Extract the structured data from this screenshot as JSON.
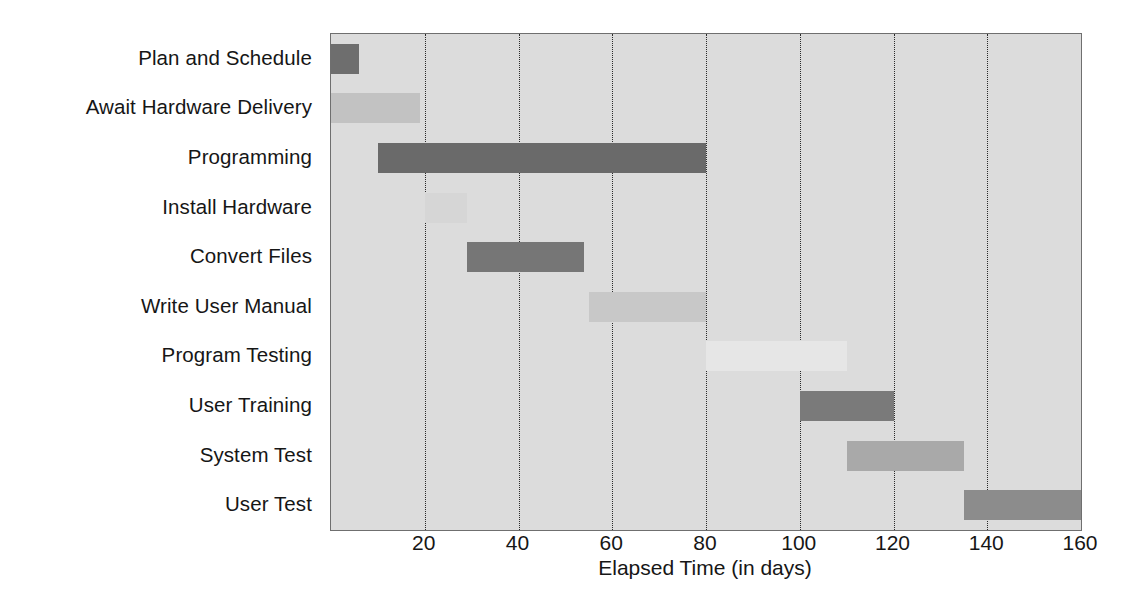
{
  "chart_data": {
    "type": "bar",
    "subtype": "gantt",
    "title": "",
    "xlabel": "Elapsed Time (in days)",
    "ylabel": "",
    "xlim": [
      0,
      160
    ],
    "xticks": [
      20,
      40,
      60,
      80,
      100,
      120,
      140,
      160
    ],
    "xtick_labels": [
      "20",
      "40",
      "60",
      "80",
      "100",
      "120",
      "140",
      "160"
    ],
    "grid": "vertical-dotted",
    "legend": "none",
    "categories": [
      "Plan and Schedule",
      "Await Hardware Delivery",
      "Programming",
      "Install Hardware",
      "Convert Files",
      "Write User Manual",
      "Program Testing",
      "User Training",
      "System Test",
      "User Test"
    ],
    "tasks": [
      {
        "name": "Plan and Schedule",
        "start": 0,
        "end": 6,
        "duration": 6,
        "color": "#6e6e6e"
      },
      {
        "name": "Await Hardware Delivery",
        "start": 0,
        "end": 19,
        "duration": 19,
        "color": "#c2c2c2"
      },
      {
        "name": "Programming",
        "start": 10,
        "end": 80,
        "duration": 70,
        "color": "#6a6a6a"
      },
      {
        "name": "Install Hardware",
        "start": 20,
        "end": 29,
        "duration": 9,
        "color": "#d6d6d6"
      },
      {
        "name": "Convert Files",
        "start": 29,
        "end": 54,
        "duration": 25,
        "color": "#767676"
      },
      {
        "name": "Write User Manual",
        "start": 55,
        "end": 80,
        "duration": 25,
        "color": "#c8c8c8"
      },
      {
        "name": "Program Testing",
        "start": 80,
        "end": 110,
        "duration": 30,
        "color": "#e6e6e6"
      },
      {
        "name": "User Training",
        "start": 100,
        "end": 120,
        "duration": 20,
        "color": "#7a7a7a"
      },
      {
        "name": "System Test",
        "start": 110,
        "end": 135,
        "duration": 25,
        "color": "#a9a9a9"
      },
      {
        "name": "User Test",
        "start": 135,
        "end": 160,
        "duration": 25,
        "color": "#8c8c8c"
      }
    ]
  },
  "style": {
    "plot_background": "#dcdcdc",
    "page_background": "#ffffff",
    "axis_color": "#6f6f6f",
    "gridline_color": "#2a2a2a",
    "text_color": "#161616"
  }
}
